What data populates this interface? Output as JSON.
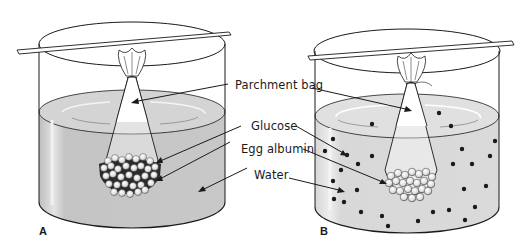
{
  "figure": {
    "panels": [
      {
        "id": "A",
        "label": "A",
        "state": "initial - glucose and egg albumin inside bag"
      },
      {
        "id": "B",
        "label": "B",
        "state": "later - glucose has diffused into water, egg albumin remains in bag"
      }
    ],
    "labels": {
      "parchment_bag": "Parchment bag",
      "glucose": "Glucose",
      "egg_albumin": "Egg albumin",
      "water": "Water"
    },
    "colors": {
      "water": "#c9c9c9",
      "water_dark": "#b5b5b5",
      "outline": "#1a1a1a",
      "glucose_dot": "#1a1a1a",
      "albumin_ball": "#f2f2f2"
    }
  }
}
